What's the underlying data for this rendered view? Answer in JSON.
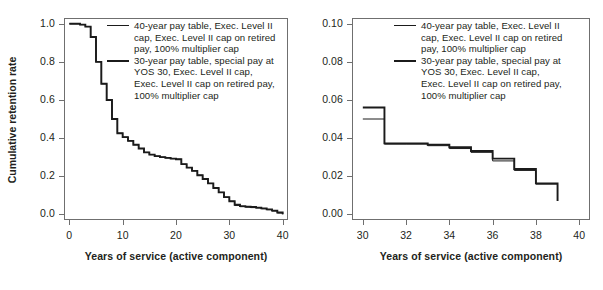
{
  "figure": {
    "panels": [
      {
        "id": "left",
        "ylabel": "Cumulative retention rate",
        "xlabel": "Years of service (active component)",
        "yticks": [
          "0.0",
          "0.2",
          "0.4",
          "0.6",
          "0.8",
          "1.0"
        ],
        "xticks": [
          "0",
          "10",
          "20",
          "30",
          "40"
        ]
      },
      {
        "id": "right",
        "ylabel": "",
        "xlabel": "Years of service (active component)",
        "yticks": [
          "0.00",
          "0.02",
          "0.04",
          "0.06",
          "0.08",
          "0.10"
        ],
        "xticks": [
          "30",
          "32",
          "34",
          "36",
          "38",
          "40"
        ]
      }
    ],
    "legend": {
      "entries": [
        {
          "key": "thin",
          "lines": [
            "40-year pay table, Exec. Level II",
            "cap, Exec. Level II cap on retired",
            "pay, 100% multiplier cap"
          ]
        },
        {
          "key": "thick",
          "lines": [
            "30-year pay table, special pay at",
            "YOS 30, Exec. Level II cap,",
            "Exec. Level II cap on retired pay,",
            "100% multiplier cap"
          ]
        }
      ]
    },
    "colors": {
      "line": "#1b1b1b",
      "frame": "#6f6f6f",
      "text": "#231f20",
      "background": "#ffffff"
    }
  },
  "chart_data": [
    {
      "type": "line",
      "id": "left-panel-full-range",
      "title": "",
      "xlabel": "Years of service (active component)",
      "ylabel": "Cumulative retention rate",
      "xlim": [
        -1,
        41
      ],
      "ylim": [
        -0.03,
        1.03
      ],
      "xticks": [
        0,
        10,
        20,
        30,
        40
      ],
      "yticks": [
        0.0,
        0.2,
        0.4,
        0.6,
        0.8,
        1.0
      ],
      "grid": false,
      "legend_position": "top-right-inside",
      "step": "post",
      "series": [
        {
          "name": "40-year pay table, Exec. Level II cap, Exec. Level II cap on retired pay, 100% multiplier cap",
          "style": "thin",
          "x": [
            0,
            1,
            2,
            3,
            4,
            5,
            6,
            7,
            8,
            9,
            10,
            11,
            12,
            13,
            14,
            15,
            16,
            17,
            18,
            19,
            20,
            21,
            22,
            23,
            24,
            25,
            26,
            27,
            28,
            29,
            30,
            31,
            32,
            33,
            34,
            35,
            36,
            37,
            38,
            39,
            40
          ],
          "values": [
            1.0,
            1.0,
            0.995,
            0.985,
            0.93,
            0.8,
            0.685,
            0.6,
            0.5,
            0.425,
            0.405,
            0.385,
            0.365,
            0.345,
            0.325,
            0.313,
            0.305,
            0.3,
            0.296,
            0.292,
            0.289,
            0.263,
            0.245,
            0.228,
            0.205,
            0.185,
            0.162,
            0.138,
            0.115,
            0.09,
            0.068,
            0.046,
            0.04,
            0.037,
            0.035,
            0.033,
            0.029,
            0.024,
            0.017,
            0.007,
            0.0
          ]
        },
        {
          "name": "30-year pay table, special pay at YOS 30, Exec. Level II cap, Exec. Level II cap on retired pay, 100% multiplier cap",
          "style": "thick",
          "x": [
            0,
            1,
            2,
            3,
            4,
            5,
            6,
            7,
            8,
            9,
            10,
            11,
            12,
            13,
            14,
            15,
            16,
            17,
            18,
            19,
            20,
            21,
            22,
            23,
            24,
            25,
            26,
            27,
            28,
            29,
            30,
            31,
            32,
            33,
            34,
            35,
            36,
            37,
            38,
            39,
            40
          ],
          "values": [
            1.0,
            1.0,
            0.995,
            0.985,
            0.93,
            0.8,
            0.685,
            0.6,
            0.5,
            0.425,
            0.405,
            0.385,
            0.365,
            0.345,
            0.325,
            0.313,
            0.305,
            0.3,
            0.296,
            0.292,
            0.289,
            0.263,
            0.245,
            0.228,
            0.205,
            0.185,
            0.162,
            0.138,
            0.115,
            0.09,
            0.068,
            0.05,
            0.043,
            0.04,
            0.038,
            0.035,
            0.031,
            0.026,
            0.019,
            0.009,
            0.0
          ]
        }
      ]
    },
    {
      "type": "line",
      "id": "right-panel-zoom",
      "title": "",
      "xlabel": "Years of service (active component)",
      "ylabel": "",
      "xlim": [
        29.5,
        40.5
      ],
      "ylim": [
        -0.003,
        0.103
      ],
      "xticks": [
        30,
        32,
        34,
        36,
        38,
        40
      ],
      "yticks": [
        0.0,
        0.02,
        0.04,
        0.06,
        0.08,
        0.1
      ],
      "grid": false,
      "legend_position": "top-right-inside",
      "step": "post",
      "series": [
        {
          "name": "40-year pay table, Exec. Level II cap, Exec. Level II cap on retired pay, 100% multiplier cap",
          "style": "thin",
          "x": [
            30,
            31,
            32,
            33,
            34,
            35,
            36,
            37,
            38,
            39
          ],
          "values": [
            0.05,
            0.0368,
            0.0368,
            0.036,
            0.0345,
            0.0325,
            0.028,
            0.023,
            0.0158,
            0.007
          ]
        },
        {
          "name": "30-year pay table, special pay at YOS 30, Exec. Level II cap, Exec. Level II cap on retired pay, 100% multiplier cap",
          "style": "thick",
          "x": [
            30,
            31,
            32,
            33,
            34,
            35,
            36,
            37,
            38,
            39
          ],
          "values": [
            0.056,
            0.0372,
            0.0372,
            0.0365,
            0.0352,
            0.0332,
            0.0292,
            0.0238,
            0.0162,
            0.007
          ]
        }
      ]
    }
  ]
}
